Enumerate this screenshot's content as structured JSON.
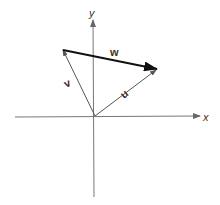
{
  "diagram": {
    "title": "",
    "axes": {
      "x_label": "x",
      "y_label": "y",
      "origin": [
        95,
        116
      ],
      "x_axis": {
        "from": [
          15,
          117
        ],
        "to": [
          200,
          116
        ]
      },
      "y_axis": {
        "from": [
          94,
          197
        ],
        "to": [
          93,
          20
        ]
      }
    },
    "vectors": [
      {
        "name": "u",
        "label": "u",
        "from": [
          95,
          116
        ],
        "to": [
          156,
          70
        ],
        "style": "thin",
        "color": "#555555"
      },
      {
        "name": "v",
        "label": "v",
        "from": [
          95,
          116
        ],
        "to": [
          63,
          50
        ],
        "style": "thin",
        "color": "#555555"
      },
      {
        "name": "w",
        "label": "w",
        "from": [
          63,
          50
        ],
        "to": [
          157,
          69
        ],
        "style": "bold",
        "color": "#111111"
      }
    ],
    "colors": {
      "axis": "#777777",
      "thin_vector": "#555555",
      "bold_vector": "#111111",
      "text": "#333333"
    }
  }
}
